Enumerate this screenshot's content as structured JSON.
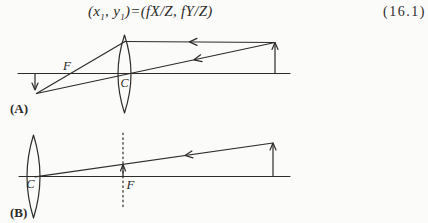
{
  "colors": {
    "ink": "#2e2b28",
    "paper": "#fbfbfa"
  },
  "equation": {
    "lhs_open": "(x",
    "x_sub": "1",
    "lhs_mid": ", y",
    "y_sub": "1",
    "rhs": ")=(fX/Z, fY/Z",
    "close": ")",
    "number": "(16.1)"
  },
  "diagram_a": {
    "panel_label": "(A)",
    "focal_point_label": "F",
    "lens_center_label": "C"
  },
  "diagram_b": {
    "panel_label": "(B)",
    "focal_point_label": "F",
    "lens_center_label": "C"
  }
}
